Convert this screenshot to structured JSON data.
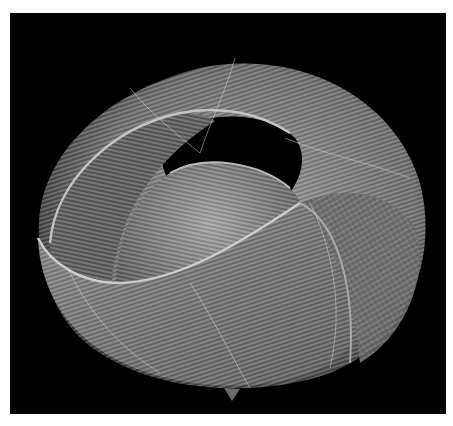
{
  "image": {
    "subject": "woven bamboo sculpture",
    "description": "Twisted looping woven form of parallel gray strands on black background",
    "background_color": "#000000",
    "page_color": "#ffffff",
    "strand_color_light": "#b8b8b8",
    "strand_color_mid": "#7a7a7a",
    "strand_color_dark": "#3a3a3a"
  },
  "caption": {
    "text": ""
  }
}
